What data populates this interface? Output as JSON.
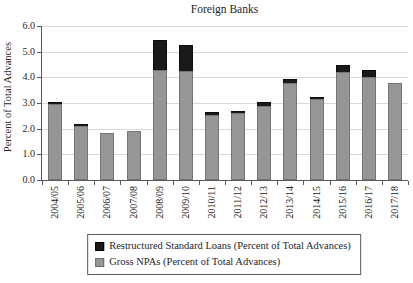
{
  "chart_data": {
    "type": "bar",
    "stacked": true,
    "title": "Foreign Banks",
    "ylabel": "Percent of Total Advances",
    "xlabel": "",
    "ylim": [
      0,
      6
    ],
    "ytick_labels": [
      "0.0",
      "1.0",
      "2.0",
      "3.0",
      "4.0",
      "5.0",
      "6.0"
    ],
    "grid": "horizontal",
    "legend_position": "bottom-center-boxed",
    "categories": [
      "2004/05",
      "2005/06",
      "2006/07",
      "2007/08",
      "2008/09",
      "2009/10",
      "2010/11",
      "2011/12",
      "2012/13",
      "2013/14",
      "2014/15",
      "2015/16",
      "2016/17",
      "2017/18"
    ],
    "series": [
      {
        "name": "Restructured Standard Loans (Percent of Total Advances)",
        "color": "#1a1a1a",
        "values": [
          0.1,
          0.1,
          0.0,
          0.0,
          1.15,
          1.0,
          0.1,
          0.1,
          0.15,
          0.15,
          0.1,
          0.3,
          0.3,
          0.0
        ]
      },
      {
        "name": "Gross NPAs (Percent of Total Advances)",
        "color": "#969696",
        "values": [
          2.95,
          2.1,
          1.85,
          1.9,
          4.3,
          4.25,
          2.55,
          2.6,
          2.9,
          3.8,
          3.15,
          4.2,
          4.0,
          3.8
        ]
      }
    ],
    "stack_totals": [
      3.05,
      2.2,
      1.85,
      1.9,
      5.45,
      5.25,
      2.65,
      2.7,
      3.05,
      3.95,
      3.25,
      4.5,
      4.3,
      3.8
    ]
  },
  "colors": {
    "background": "#ffffff",
    "gridline": "#d9d9d9",
    "axis": "#595959",
    "text": "#262626",
    "bar_black": "#1a1a1a",
    "bar_gray": "#969696",
    "legend_border": "#595959"
  }
}
